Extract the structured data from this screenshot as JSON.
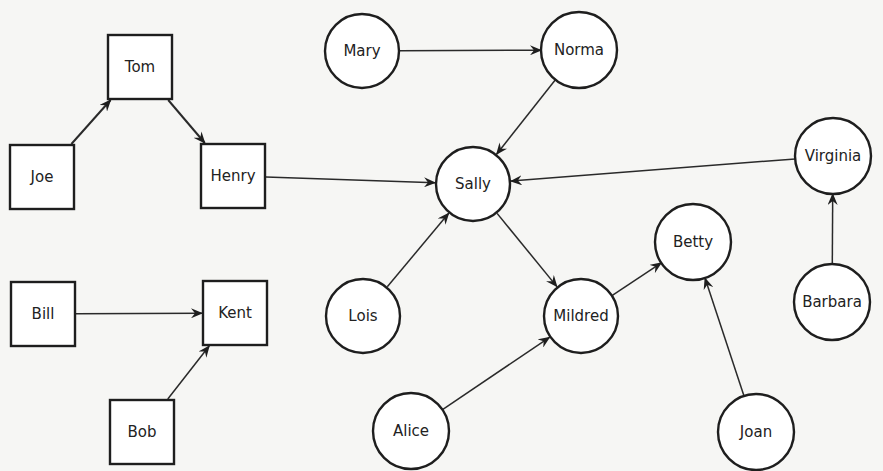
{
  "diagram": {
    "type": "directed sociogram",
    "nodes": {
      "tom": {
        "label": "Tom",
        "shape": "square",
        "x": 140,
        "y": 67
      },
      "joe": {
        "label": "Joe",
        "shape": "square",
        "x": 42,
        "y": 177
      },
      "henry": {
        "label": "Henry",
        "shape": "square",
        "x": 233,
        "y": 176
      },
      "bill": {
        "label": "Bill",
        "shape": "square",
        "x": 43,
        "y": 314
      },
      "kent": {
        "label": "Kent",
        "shape": "square",
        "x": 235,
        "y": 313
      },
      "bob": {
        "label": "Bob",
        "shape": "square",
        "x": 142,
        "y": 432
      },
      "mary": {
        "label": "Mary",
        "shape": "circle",
        "x": 362,
        "y": 51
      },
      "norma": {
        "label": "Norma",
        "shape": "circle",
        "x": 579,
        "y": 50
      },
      "sally": {
        "label": "Sally",
        "shape": "circle",
        "x": 473,
        "y": 184
      },
      "virginia": {
        "label": "Virginia",
        "shape": "circle",
        "x": 833,
        "y": 156
      },
      "betty": {
        "label": "Betty",
        "shape": "circle",
        "x": 693,
        "y": 242
      },
      "lois": {
        "label": "Lois",
        "shape": "circle",
        "x": 363,
        "y": 316
      },
      "mildred": {
        "label": "Mildred",
        "shape": "circle",
        "x": 581,
        "y": 316
      },
      "barbara": {
        "label": "Barbara",
        "shape": "circle",
        "x": 832,
        "y": 302
      },
      "alice": {
        "label": "Alice",
        "shape": "circle",
        "x": 411,
        "y": 431
      },
      "joan": {
        "label": "Joan",
        "shape": "circle",
        "x": 756,
        "y": 432
      }
    },
    "edges": [
      {
        "from": "joe",
        "to": "tom"
      },
      {
        "from": "tom",
        "to": "henry"
      },
      {
        "from": "henry",
        "to": "sally"
      },
      {
        "from": "bill",
        "to": "kent"
      },
      {
        "from": "bob",
        "to": "kent"
      },
      {
        "from": "mary",
        "to": "norma"
      },
      {
        "from": "norma",
        "to": "sally"
      },
      {
        "from": "virginia",
        "to": "sally"
      },
      {
        "from": "lois",
        "to": "sally"
      },
      {
        "from": "sally",
        "to": "mildred"
      },
      {
        "from": "alice",
        "to": "mildred"
      },
      {
        "from": "mildred",
        "to": "betty"
      },
      {
        "from": "joan",
        "to": "betty"
      },
      {
        "from": "barbara",
        "to": "virginia"
      }
    ],
    "style": {
      "square_size": 64,
      "circle_radius": 37,
      "stroke_color": "#1e1e1e",
      "background": "#f6f6f4"
    }
  }
}
